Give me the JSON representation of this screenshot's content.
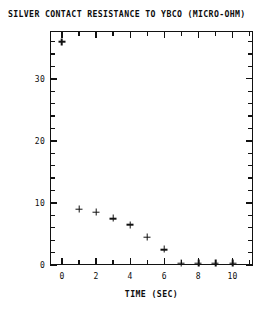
{
  "chart_data": {
    "type": "scatter",
    "title": "SILVER CONTACT RESISTANCE TO YBCO (MICRO-OHM)",
    "xlabel": "TIME (SEC)",
    "ylabel": "",
    "marker": "plus",
    "grid": false,
    "legend": null,
    "xlim": [
      -0.7,
      11.2
    ],
    "ylim": [
      0,
      37.7
    ],
    "x": [
      0,
      1,
      2,
      3,
      4,
      5,
      6,
      7,
      8,
      9,
      10
    ],
    "values": [
      36.0,
      9.0,
      8.5,
      7.5,
      6.5,
      4.5,
      2.5,
      0.3,
      0.3,
      0.3,
      0.3
    ],
    "xticks": [
      0,
      2,
      4,
      6,
      8,
      10
    ],
    "xtick_labels": [
      "0",
      "2",
      "4",
      "6",
      "8",
      "10"
    ],
    "xticks_minor_step": 1,
    "yticks": [
      0,
      10,
      20,
      30
    ],
    "ytick_labels": [
      "0",
      "10",
      "20",
      "30"
    ],
    "yticks_minor_step": 2,
    "frame": {
      "left": 50,
      "top": 31,
      "width": 203,
      "height": 234
    },
    "colors": {
      "axis": "#121212",
      "marker": "#111111",
      "background": "#ffffff",
      "text": "#0d0d0d"
    }
  }
}
